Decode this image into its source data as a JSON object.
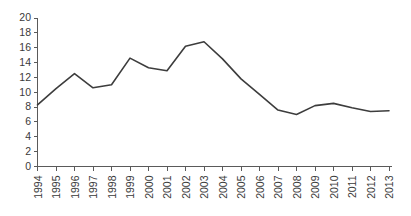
{
  "chart_data": {
    "type": "line",
    "title": "",
    "subtitle": "",
    "xlabel": "",
    "ylabel": "",
    "categories": [
      "1994",
      "1995",
      "1996",
      "1997",
      "1998",
      "1999",
      "2000",
      "2001",
      "2002",
      "2003",
      "2004",
      "2005",
      "2006",
      "2007",
      "2008",
      "2009",
      "2010",
      "2011",
      "2012",
      "2013"
    ],
    "values": [
      8.3,
      10.5,
      12.5,
      10.6,
      11.0,
      14.6,
      13.3,
      12.9,
      16.2,
      16.8,
      14.5,
      11.8,
      9.7,
      7.6,
      7.0,
      8.2,
      8.5,
      7.9,
      7.4,
      7.5
    ],
    "series": [
      {
        "name": "",
        "values": [
          8.3,
          10.5,
          12.5,
          10.6,
          11.0,
          14.6,
          13.3,
          12.9,
          16.2,
          16.8,
          14.5,
          11.8,
          9.7,
          7.6,
          7.0,
          8.2,
          8.5,
          7.9,
          7.4,
          7.5
        ]
      }
    ],
    "ylim": [
      0,
      20
    ],
    "ytick_values": [
      0,
      2,
      4,
      6,
      8,
      10,
      12,
      14,
      16,
      18,
      20
    ],
    "ytick_labels": [
      "0",
      "2",
      "4",
      "6",
      "8",
      "10",
      "12",
      "14",
      "16",
      "18",
      "20"
    ],
    "xtick_labels": [
      "1994",
      "1995",
      "1996",
      "1997",
      "1998",
      "1999",
      "2000",
      "2001",
      "2002",
      "2003",
      "2004",
      "2005",
      "2006",
      "2007",
      "2008",
      "2009",
      "2010",
      "2011",
      "2012",
      "2013"
    ],
    "xtick_rotation": -90,
    "grid": false,
    "legend": false,
    "legend_position": "none",
    "annotations": [],
    "line_color": "#3d3d3d",
    "axis_color": "#5a5a5a",
    "background_color": "#ffffff",
    "markers": false
  }
}
